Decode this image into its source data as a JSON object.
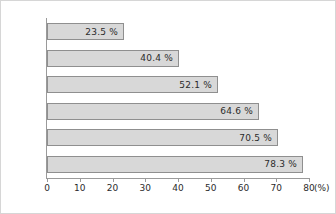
{
  "chart_data": {
    "type": "bar",
    "orientation": "horizontal",
    "title": "",
    "subtitle": "",
    "xlabel": "(%)",
    "ylabel": "",
    "categories": [
      "1학년",
      "2학년",
      "3학년",
      "4학년",
      "5학년",
      "6학년"
    ],
    "values": [
      23.5,
      40.4,
      52.1,
      64.6,
      70.5,
      78.3
    ],
    "value_labels": [
      "23.5 %",
      "40.4 %",
      "52.1 %",
      "64.6 %",
      "70.5 %",
      "78.3 %"
    ],
    "xlim": [
      0,
      80
    ],
    "xticks": [
      0,
      10,
      20,
      30,
      40,
      50,
      60,
      70,
      80
    ],
    "xtick_labels": [
      "0",
      "10",
      "20",
      "30",
      "40",
      "50",
      "60",
      "70",
      "80"
    ],
    "unit_label": "(%)",
    "grid": false,
    "legend": null,
    "colors": {
      "bar_fill": "#d8d8d8",
      "bar_border": "#8f8f8f",
      "axis": "#9a9a9a",
      "text": "#2b2b2b",
      "frame_border": "#d6d6d6",
      "background": "#ffffff"
    }
  }
}
